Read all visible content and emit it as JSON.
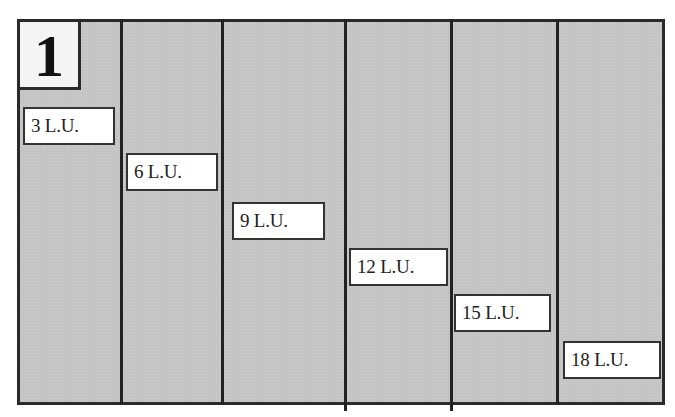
{
  "diagram": {
    "panel_number": "1",
    "colors": {
      "frame_border": "#2a2a2a",
      "column_fill": "#c4c4c4",
      "label_fill": "#ffffff",
      "text": "#222222"
    },
    "columns": [
      {
        "label": "3 L.U."
      },
      {
        "label": "6 L.U."
      },
      {
        "label": "9 L.U."
      },
      {
        "label": "12 L.U."
      },
      {
        "label": "15 L.U."
      },
      {
        "label": "18 L.U."
      }
    ]
  }
}
